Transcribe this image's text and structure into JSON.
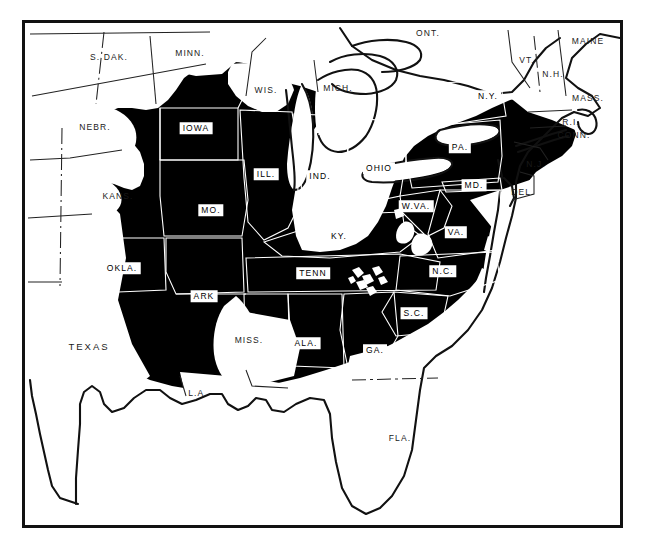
{
  "figure": {
    "type": "distribution-range-map",
    "region": "Eastern and Central United States",
    "frame": {
      "x": 22,
      "y": 20,
      "width": 601,
      "height": 508
    },
    "colors": {
      "shaded_range": "#000000",
      "unshaded_land": "#ffffff",
      "outline": "#111111",
      "state_border": "#ffffff",
      "frame": "#111111",
      "background": "#ffffff"
    }
  },
  "labels": {
    "boxed": [
      {
        "text": "IOWA",
        "x": 196,
        "y": 128,
        "shaded": true
      },
      {
        "text": "ILL.",
        "x": 266,
        "y": 174,
        "shaded": true
      },
      {
        "text": "IND.",
        "x": 320,
        "y": 176,
        "shaded": true
      },
      {
        "text": "OHIO",
        "x": 379,
        "y": 168,
        "shaded": true
      },
      {
        "text": "PA.",
        "x": 460,
        "y": 147,
        "shaded": true
      },
      {
        "text": "N.Y.",
        "x": 488,
        "y": 96,
        "shaded": true
      },
      {
        "text": "MO.",
        "x": 211,
        "y": 210,
        "shaded": true
      },
      {
        "text": "KY.",
        "x": 339,
        "y": 236,
        "shaded": true
      },
      {
        "text": "W.VA.",
        "x": 416,
        "y": 206,
        "shaded": true
      },
      {
        "text": "VA.",
        "x": 456,
        "y": 232,
        "shaded": true
      },
      {
        "text": "MD.",
        "x": 474,
        "y": 185,
        "shaded": true
      },
      {
        "text": "OKLA.",
        "x": 122,
        "y": 268,
        "shaded": true
      },
      {
        "text": "ARK",
        "x": 204,
        "y": 296,
        "shaded": true
      },
      {
        "text": "TENN",
        "x": 313,
        "y": 273,
        "shaded": true
      },
      {
        "text": "N.C.",
        "x": 443,
        "y": 271,
        "shaded": true
      },
      {
        "text": "S.C.",
        "x": 414,
        "y": 313,
        "shaded": true
      },
      {
        "text": "ALA.",
        "x": 306,
        "y": 343,
        "shaded": true
      },
      {
        "text": "GA.",
        "x": 375,
        "y": 350,
        "shaded": true
      }
    ],
    "plain": [
      {
        "text": "S. DAK.",
        "x": 109,
        "y": 57,
        "size": "normal"
      },
      {
        "text": "MINN.",
        "x": 190,
        "y": 53,
        "size": "normal"
      },
      {
        "text": "WIS.",
        "x": 266,
        "y": 90,
        "size": "normal"
      },
      {
        "text": "MICH.",
        "x": 338,
        "y": 88,
        "size": "normal"
      },
      {
        "text": "ONT.",
        "x": 428,
        "y": 33,
        "size": "normal"
      },
      {
        "text": "VT.",
        "x": 527,
        "y": 60,
        "size": "normal"
      },
      {
        "text": "N.H.",
        "x": 553,
        "y": 74,
        "size": "normal"
      },
      {
        "text": "MAINE",
        "x": 588,
        "y": 41,
        "size": "normal"
      },
      {
        "text": "MASS.",
        "x": 588,
        "y": 98,
        "size": "normal"
      },
      {
        "text": "R.I.",
        "x": 571,
        "y": 122,
        "size": "normal"
      },
      {
        "text": "CONN.",
        "x": 574,
        "y": 135,
        "size": "normal"
      },
      {
        "text": "N.J.",
        "x": 536,
        "y": 164,
        "size": "normal"
      },
      {
        "text": "DEL.",
        "x": 523,
        "y": 192,
        "size": "normal"
      },
      {
        "text": "NEBR.",
        "x": 95,
        "y": 127,
        "size": "normal"
      },
      {
        "text": "KANS.",
        "x": 118,
        "y": 196,
        "size": "normal"
      },
      {
        "text": "TEXAS",
        "x": 89,
        "y": 347,
        "size": "big"
      },
      {
        "text": "MISS.",
        "x": 249,
        "y": 340,
        "size": "normal"
      },
      {
        "text": "L.A.",
        "x": 198,
        "y": 393,
        "size": "normal"
      },
      {
        "text": "FLA.",
        "x": 400,
        "y": 438,
        "size": "normal"
      }
    ]
  },
  "chart_data": {
    "type": "map",
    "title": "",
    "legend": [],
    "shaded_states": [
      "IOWA",
      "ILL.",
      "IND.",
      "OHIO",
      "PA.",
      "N.Y.",
      "MO.",
      "KY.",
      "W.VA.",
      "VA.",
      "MD.",
      "OKLA.",
      "ARK",
      "TENN",
      "N.C.",
      "S.C.",
      "ALA.",
      "GA."
    ],
    "unshaded_states": [
      "S. DAK.",
      "MINN.",
      "WIS.",
      "MICH.",
      "VT.",
      "N.H.",
      "MAINE",
      "MASS.",
      "R.I.",
      "CONN.",
      "N.J.",
      "DEL.",
      "NEBR.",
      "KANS.",
      "TEXAS",
      "MISS.",
      "L.A.",
      "FLA.",
      "ONT."
    ]
  }
}
